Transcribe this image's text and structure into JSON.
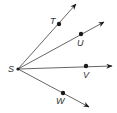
{
  "diagram": {
    "type": "rays-from-common-vertex",
    "colors": {
      "line": "#555555",
      "point": "#1a1a1a",
      "label": "#333333"
    },
    "vertex": {
      "label": "S",
      "x": 18,
      "y": 69,
      "label_x": 8,
      "label_y": 72
    },
    "rays": [
      {
        "name": "ST",
        "point_label": "T",
        "point": {
          "x": 59,
          "y": 24
        },
        "tip": {
          "x": 76,
          "y": 4
        },
        "label_x": 50,
        "label_y": 24
      },
      {
        "name": "SU",
        "point_label": "U",
        "point": {
          "x": 81,
          "y": 34
        },
        "tip": {
          "x": 104,
          "y": 22
        },
        "label_x": 77,
        "label_y": 46
      },
      {
        "name": "SV",
        "point_label": "V",
        "point": {
          "x": 86,
          "y": 66
        },
        "tip": {
          "x": 112,
          "y": 66
        },
        "label_x": 83,
        "label_y": 78
      },
      {
        "name": "SW",
        "point_label": "W",
        "point": {
          "x": 63,
          "y": 93
        },
        "tip": {
          "x": 89,
          "y": 107
        },
        "label_x": 56,
        "label_y": 104
      }
    ]
  }
}
